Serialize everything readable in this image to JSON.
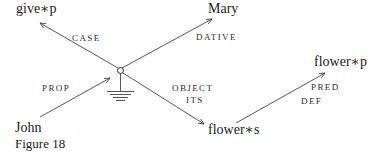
{
  "figure": {
    "caption": "Figure 18",
    "colors": {
      "ink": "#1a1a1a",
      "background": "#ffffff"
    }
  },
  "nodes": {
    "give": "give∗p",
    "mary": "Mary",
    "john": "John",
    "flower_s": "flower∗s",
    "flower_p": "flower∗p"
  },
  "edges": {
    "case": "CASE",
    "dative": "DATIVE",
    "prop": "PROP",
    "object": "OBJECT",
    "its": "ITS",
    "pred": "PRED",
    "def": "DEF"
  },
  "icons": {
    "center_node": "small-circle",
    "ground": "ground-symbol"
  }
}
